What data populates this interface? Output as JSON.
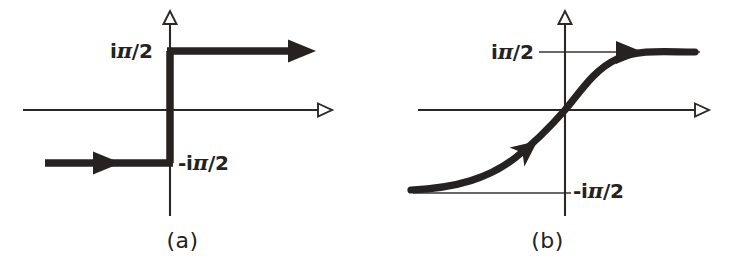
{
  "figure": {
    "background_color": "#ffffff",
    "ink_color": "#262220",
    "width": 730,
    "height": 276
  },
  "panels": [
    {
      "id": "a",
      "caption": "(a)",
      "caption_x": 183,
      "caption_y": 228,
      "kind": "step-function",
      "description": "Piecewise constant step: value -iπ/2 for x<0, jump at origin, value iπ/2 for x>0",
      "axes": {
        "x_axis": {
          "y": 110,
          "x_start": 23,
          "x_end": 322,
          "arrow": "hollow-right"
        },
        "y_axis": {
          "x": 170,
          "y_start": 216,
          "y_end": 16,
          "arrow": "hollow-up"
        }
      },
      "labels": [
        {
          "name": "upper-level-label",
          "text": "iπ/2",
          "prefix": "i",
          "symbol": "π",
          "suffix": "/2",
          "x": 112,
          "y": 40,
          "level": "iπ/2"
        },
        {
          "name": "lower-level-label",
          "text": "-iπ/2",
          "prefix": "-i",
          "symbol": "π",
          "suffix": "/2",
          "x": 178,
          "y": 152,
          "level": "-iπ/2"
        }
      ],
      "levels": {
        "upper_y": 51,
        "lower_y": 163
      },
      "rays": [
        {
          "name": "upper-ray",
          "text": "ray from origin rightward at iπ/2",
          "from_x": 170,
          "to_x": 300,
          "y": 51,
          "arrow": "solid-right",
          "arrow_at_x": 300
        },
        {
          "name": "lower-ray",
          "text": "ray from left edge to origin at -iπ/2",
          "from_x": 45,
          "to_x": 170,
          "y": 163,
          "arrow": "solid-right",
          "arrow_at_x": 112
        },
        {
          "name": "vertical-jump",
          "text": "vertical jump segment at x=0",
          "x": 170,
          "from_y": 51,
          "to_y": 163
        }
      ]
    },
    {
      "id": "b",
      "caption": "(b)",
      "caption_x": 183,
      "caption_y": 228,
      "kind": "smooth-sigmoid",
      "description": "Smooth arctan-like curve rising from asymptote -iπ/2 through origin to asymptote iπ/2",
      "axes": {
        "x_axis": {
          "y": 110,
          "x_start": 53,
          "x_end": 335,
          "arrow": "hollow-right"
        },
        "y_axis": {
          "x": 200,
          "y_start": 216,
          "y_end": 16,
          "arrow": "hollow-up"
        }
      },
      "labels": [
        {
          "name": "upper-level-label",
          "text": "iπ/2",
          "prefix": "i",
          "symbol": "π",
          "suffix": "/2",
          "x": 128,
          "y": 41,
          "level": "iπ/2"
        },
        {
          "name": "lower-level-label",
          "text": "-iπ/2",
          "prefix": "-i",
          "symbol": "π",
          "suffix": "/2",
          "x": 208,
          "y": 180,
          "level": "-iπ/2"
        }
      ],
      "levels": {
        "upper_y": 52,
        "lower_y": 193
      },
      "asymptotes": [
        {
          "name": "upper-asymptote",
          "y": 52,
          "x_start": 174,
          "x_end": 335,
          "level": "iπ/2"
        },
        {
          "name": "lower-asymptote",
          "y": 193,
          "x_start": 48,
          "x_end": 206,
          "level": "-iπ/2"
        }
      ],
      "curve": {
        "name": "sigmoid-curve",
        "x_start": 46,
        "x_end": 330,
        "y_start": 190,
        "y_end": 54,
        "midpoint_x": 200,
        "midpoint_y": 110,
        "arrows": [
          {
            "name": "left-tail-arrow",
            "x": 140,
            "y": 168,
            "angle_deg": 42,
            "style": "solid-right"
          },
          {
            "name": "right-tail-arrow",
            "x": 258,
            "y": 55,
            "angle_deg": 0,
            "style": "solid-right"
          }
        ]
      }
    }
  ]
}
